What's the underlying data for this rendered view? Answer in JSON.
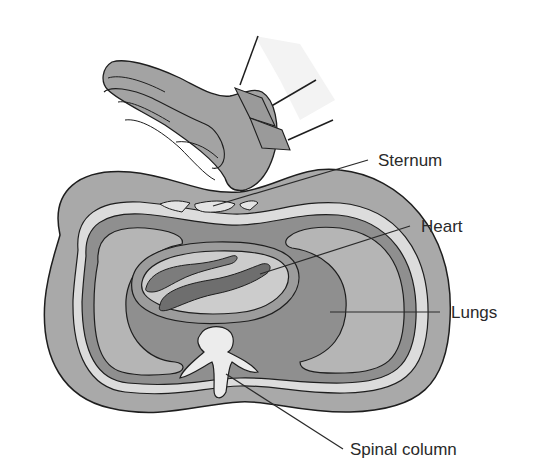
{
  "figure": {
    "labels": {
      "sternum": "Sternum",
      "heart": "Heart",
      "lungs": "Lungs",
      "spinal_column": "Spinal column"
    },
    "colors": {
      "body_fill": "#a8a8a8",
      "lung_fill": "#b4b4b4",
      "pleura_band": "#8c8c8c",
      "light_band": "#dcdcdc",
      "heart_fill": "#c8c8c8",
      "heart_chamber": "#7a7a7a",
      "glove_fill": "#a0a0a0",
      "sleeve_fill": "#f2f2f2",
      "outline": "#1e1e1e",
      "text": "#2a2a2a"
    }
  }
}
